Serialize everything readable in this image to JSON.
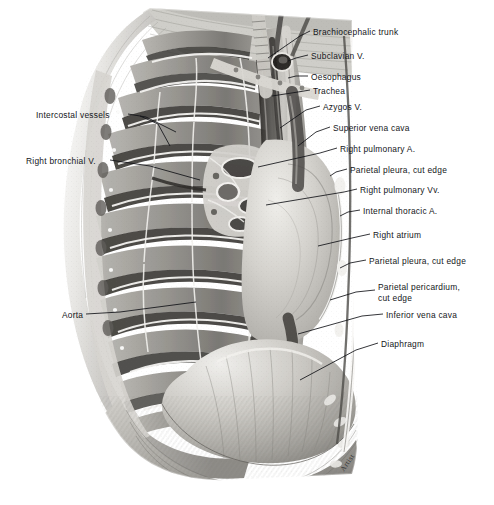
{
  "plate": {
    "title": "Right thoracic cavity — mediastinum and diaphragm",
    "medium": "grayscale anatomical engraving / wash drawing",
    "background_color": "#ffffff",
    "ink_color": "#14161a",
    "width": 494,
    "height": 505,
    "signature": "Artist"
  },
  "labels_right": [
    {
      "id": "brachiocephalic-trunk",
      "text": "Brachiocephalic trunk",
      "x": 313,
      "y": 31
    },
    {
      "id": "subclavian-vein",
      "text": "Subclavian V.",
      "x": 311,
      "y": 55
    },
    {
      "id": "oesophagus",
      "text": "Oesophagus",
      "x": 311,
      "y": 76
    },
    {
      "id": "trachea",
      "text": "Trachea",
      "x": 313,
      "y": 90
    },
    {
      "id": "azygos-vein",
      "text": "Azygos V.",
      "x": 323,
      "y": 106
    },
    {
      "id": "superior-vena-cava",
      "text": "Superior vena cava",
      "x": 333,
      "y": 127
    },
    {
      "id": "right-pulmonary-artery",
      "text": "Right pulmonary A.",
      "x": 340,
      "y": 148
    },
    {
      "id": "parietal-pleura-upper",
      "text": "Parietal pleura, cut edge",
      "x": 350,
      "y": 169
    },
    {
      "id": "right-pulmonary-veins",
      "text": "Right pulmonary Vv.",
      "x": 360,
      "y": 189
    },
    {
      "id": "internal-thoracic-artery",
      "text": "Internal thoracic A.",
      "x": 363,
      "y": 210
    },
    {
      "id": "right-atrium",
      "text": "Right atrium",
      "x": 373,
      "y": 234
    },
    {
      "id": "parietal-pleura-lower",
      "text": "Parietal pleura, cut edge",
      "x": 369,
      "y": 260
    },
    {
      "id": "parietal-pericardium",
      "text": "Parietal pericardium, cut edge",
      "x": 378,
      "y": 286
    },
    {
      "id": "inferior-vena-cava",
      "text": "Inferior vena cava",
      "x": 386,
      "y": 314
    },
    {
      "id": "diaphragm",
      "text": "Diaphragm",
      "x": 381,
      "y": 343
    }
  ],
  "labels_left": [
    {
      "id": "intercostal-vessels",
      "text": "Intercostal vessels",
      "x": 36,
      "y": 114
    },
    {
      "id": "right-bronchial-vein",
      "text": "Right bronchial V.",
      "x": 26,
      "y": 160
    },
    {
      "id": "aorta",
      "text": "Aorta",
      "x": 62,
      "y": 314
    }
  ]
}
